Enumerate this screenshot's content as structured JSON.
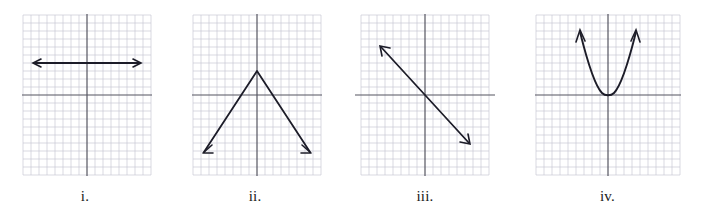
{
  "figure": {
    "caption_labels": [
      "i.",
      "ii.",
      "iii.",
      "iv."
    ],
    "background_color": "#ffffff",
    "grid_minor_color": "#c9c9d4",
    "grid_major_color": "#b3b3c0",
    "axis_color": "#555560",
    "curve_color": "#1c1c28"
  },
  "graphs": [
    {
      "id": "i",
      "label": "i.",
      "description": "horizontal line with arrowheads on both ends above the x-axis",
      "grid": {
        "cells_x": 16,
        "cells_y": 20,
        "cell_px": 8,
        "origin_cell_x": 8,
        "origin_cell_y": 10
      },
      "curve": {
        "type": "line",
        "points": [
          [
            -7,
            4
          ],
          [
            8,
            4
          ]
        ],
        "arrow_start": true,
        "arrow_end": true
      }
    },
    {
      "id": "ii",
      "label": "ii.",
      "description": "inverted V shape (negative absolute value) with vertex above the origin and arrows pointing down-left and down-right",
      "grid": {
        "cells_x": 16,
        "cells_y": 20,
        "cell_px": 8,
        "origin_cell_x": 8,
        "origin_cell_y": 10
      },
      "curve": {
        "type": "polyline",
        "points": [
          [
            -7,
            -7
          ],
          [
            0,
            3
          ],
          [
            7,
            -7
          ]
        ],
        "arrow_start": true,
        "arrow_end": true
      }
    },
    {
      "id": "iii",
      "label": "iii.",
      "description": "straight line with negative slope passing through the origin, arrowheads on both ends",
      "grid": {
        "cells_x": 16,
        "cells_y": 20,
        "cell_px": 8,
        "origin_cell_x": 8,
        "origin_cell_y": 10
      },
      "curve": {
        "type": "line",
        "points": [
          [
            -5.5,
            6
          ],
          [
            5.5,
            -6
          ]
        ],
        "arrow_start": true,
        "arrow_end": true
      }
    },
    {
      "id": "iv",
      "label": "iv.",
      "description": "narrow upward-opening parabola with vertex at the origin, arrowheads on both upward branches",
      "grid": {
        "cells_x": 18,
        "cells_y": 20,
        "cell_px": 8,
        "origin_cell_x": 9,
        "origin_cell_y": 10
      },
      "curve": {
        "type": "parabola",
        "vertex": [
          0,
          0
        ],
        "a": 1.1,
        "x_from": -2.7,
        "x_to": 2.7,
        "arrow_start": true,
        "arrow_end": true
      }
    }
  ]
}
